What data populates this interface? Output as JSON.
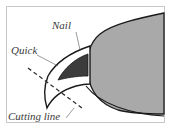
{
  "diagram": {
    "labels": {
      "nail": "Nail",
      "quick": "Quick",
      "cutting_line": "Cutting line"
    },
    "colors": {
      "paw_fill": "#a9a9a9",
      "quick_fill": "#3c3c3c",
      "outline": "#1a1a1a",
      "border": "#c8c8c8",
      "label": "#3a3a3a"
    }
  }
}
